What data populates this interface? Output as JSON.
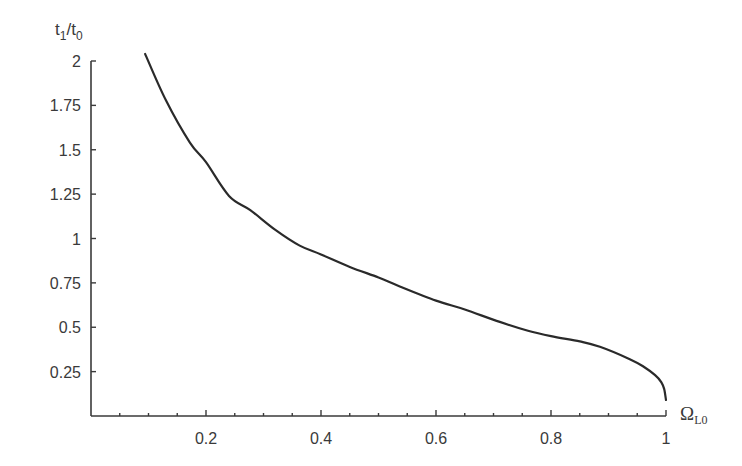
{
  "chart_data": {
    "type": "line",
    "title": "",
    "xlabel": "Ω_L0",
    "xlabel_main": "Ω",
    "xlabel_sub": "L0",
    "ylabel": "t_1/t_0",
    "ylabel_parts": {
      "t1": "t",
      "sub1": "1",
      "slash": "/",
      "t0": "t",
      "sub0": "0"
    },
    "xlim": [
      0,
      1
    ],
    "ylim": [
      0,
      2
    ],
    "x_ticks": [
      0.2,
      0.4,
      0.6,
      0.8,
      1
    ],
    "x_tick_labels": [
      "0.2",
      "0.4",
      "0.6",
      "0.8",
      "1"
    ],
    "x_minor_step": 0.05,
    "y_ticks": [
      0.25,
      0.5,
      0.75,
      1,
      1.25,
      1.5,
      1.75,
      2
    ],
    "y_tick_labels": [
      "0.25",
      "0.5",
      "0.75",
      "1",
      "1.25",
      "1.5",
      "1.75",
      "2"
    ],
    "grid": false,
    "legend": null,
    "series": [
      {
        "name": "t1/t0 vs Omega_L0",
        "color": "#2a2a2a",
        "x": [
          0.094,
          0.13,
          0.172,
          0.2,
          0.24,
          0.277,
          0.32,
          0.363,
          0.4,
          0.45,
          0.5,
          0.537,
          0.6,
          0.65,
          0.711,
          0.76,
          0.8,
          0.85,
          0.885,
          0.937,
          0.96,
          0.981,
          0.992,
          0.997,
          1.0
        ],
        "y": [
          2.04,
          1.78,
          1.54,
          1.43,
          1.24,
          1.16,
          1.05,
          0.96,
          0.91,
          0.84,
          0.78,
          0.73,
          0.65,
          0.6,
          0.53,
          0.48,
          0.45,
          0.42,
          0.39,
          0.32,
          0.28,
          0.23,
          0.19,
          0.15,
          0.09
        ]
      }
    ]
  }
}
